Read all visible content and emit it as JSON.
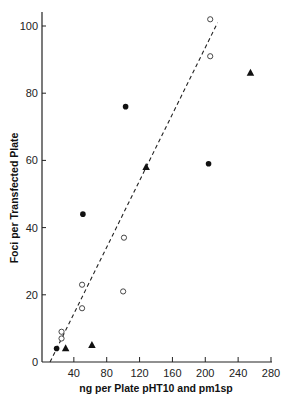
{
  "chart_data": {
    "type": "scatter",
    "title": "",
    "xlabel": "ng per Plate pHT10 and pm1sp",
    "ylabel": "Foci per Transfected Plate",
    "xlim": [
      0,
      280
    ],
    "ylim": [
      0,
      104
    ],
    "x_ticks": [
      40,
      80,
      120,
      160,
      200,
      240,
      280
    ],
    "y_ticks": [
      0,
      20,
      40,
      60,
      80,
      100
    ],
    "grid": false,
    "legend": null,
    "series": [
      {
        "name": "open circles",
        "marker": "open-circle",
        "points": [
          [
            25,
            9
          ],
          [
            25,
            7
          ],
          [
            50,
            23
          ],
          [
            50,
            16
          ],
          [
            100,
            21
          ],
          [
            101,
            37
          ],
          [
            206,
            91
          ],
          [
            206,
            102
          ]
        ]
      },
      {
        "name": "filled circles",
        "marker": "filled-circle",
        "points": [
          [
            19,
            4
          ],
          [
            51,
            44
          ],
          [
            103,
            76
          ],
          [
            204,
            59
          ]
        ]
      },
      {
        "name": "filled triangles",
        "marker": "filled-triangle",
        "points": [
          [
            30,
            4
          ],
          [
            62,
            5
          ],
          [
            128,
            58
          ],
          [
            255,
            86
          ]
        ]
      }
    ],
    "fit_line": {
      "style": "dashed",
      "from": [
        11,
        0
      ],
      "to": [
        215,
        101
      ]
    }
  },
  "labels": {
    "x_axis_title": "ng per Plate pHT10 and pm1sp",
    "y_axis_title": "Foci per Transfected Plate",
    "y_zero": "0"
  }
}
